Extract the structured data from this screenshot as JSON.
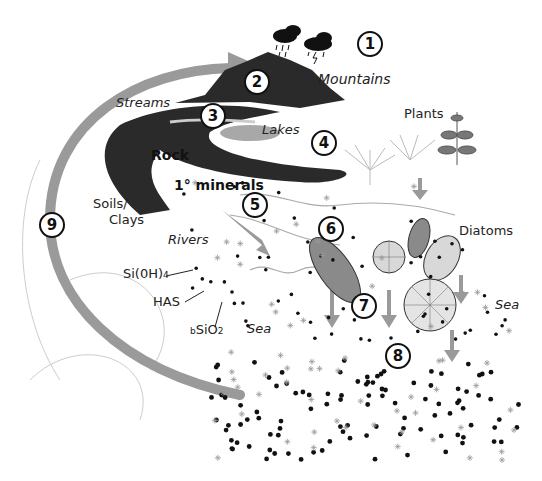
{
  "diagram": {
    "steps": [
      {
        "n": "1",
        "label": "Mountains",
        "icon": "storm-clouds-icon"
      },
      {
        "n": "2",
        "label": "Mountains weathering"
      },
      {
        "n": "3",
        "label": "Streams"
      },
      {
        "n": "4",
        "label": "Lakes"
      },
      {
        "n": "5",
        "label": "Rivers"
      },
      {
        "n": "6",
        "label": "Diatoms"
      },
      {
        "n": "7",
        "label": "Sinking"
      },
      {
        "n": "8",
        "label": "Sediment"
      },
      {
        "n": "9",
        "label": "Return cycle"
      }
    ],
    "labels": {
      "mountains": "Mountains",
      "streams": "Streams",
      "lakes": "Lakes",
      "plants": "Plants",
      "rock": "Rock",
      "minerals": "1° minerals",
      "soils": "Soils/",
      "clays": "Clays",
      "rivers": "Rivers",
      "diatoms": "Diatoms",
      "sea_right": "Sea",
      "sea_left": "Sea",
      "sioh4_main": "Si(0H)",
      "sioh4_sub": "4",
      "has": "HAS",
      "bsio2_pre": "b",
      "bsio2_main": "SiO",
      "bsio2_sub": "2"
    },
    "colors": {
      "rock": "#2a2a2a",
      "arrow": "#9a9a9a",
      "lake": "#a8a8a8",
      "diatom": "#8a8a8a"
    }
  }
}
